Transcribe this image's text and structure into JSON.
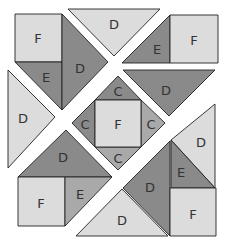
{
  "diagram": {
    "colors": {
      "light": "#dcdcdc",
      "medium": "#a9a9a9",
      "dark": "#8a8a8a",
      "outline": "#222222",
      "label": "#333333",
      "background": "#ffffff"
    },
    "pieces": [
      {
        "id": "f-top-left",
        "label": "F",
        "shape": "square",
        "shade": "light",
        "points": "15,14 62,14 62,62 15,62",
        "label_pos": [
          38,
          38
        ]
      },
      {
        "id": "e-top-left",
        "label": "E",
        "shape": "triangle",
        "shade": "dark",
        "points": "15,62 62,62 62,110",
        "label_pos": [
          46,
          77
        ]
      },
      {
        "id": "d-top-left",
        "label": "D",
        "shape": "triangle",
        "shade": "dark",
        "points": "62,14 108,62 62,110",
        "label_pos": [
          80,
          68
        ]
      },
      {
        "id": "d-top",
        "label": "D",
        "shape": "triangle",
        "shade": "light",
        "points": "68,9 160,9 114,56",
        "label_pos": [
          114,
          24
        ]
      },
      {
        "id": "e-top-right",
        "label": "E",
        "shape": "triangle",
        "shade": "dark",
        "points": "170,15 170,63 122,63",
        "label_pos": [
          157,
          49
        ]
      },
      {
        "id": "f-top-right",
        "label": "F",
        "shape": "square",
        "shade": "light",
        "points": "170,15 218,15 218,63 170,63",
        "label_pos": [
          194,
          40
        ]
      },
      {
        "id": "d-left",
        "label": "D",
        "shape": "triangle",
        "shade": "light",
        "points": "8,70 55,117 8,168",
        "label_pos": [
          23,
          118
        ]
      },
      {
        "id": "d-right-dark",
        "label": "D",
        "shape": "triangle",
        "shade": "dark",
        "points": "123,70 215,70 169,116",
        "label_pos": [
          166,
          90
        ]
      },
      {
        "id": "c-top",
        "label": "C",
        "shape": "triangle",
        "shade": "dark",
        "points": "118,76 141,100 95,100",
        "label_pos": [
          118,
          91
        ]
      },
      {
        "id": "c-left",
        "label": "C",
        "shape": "triangle",
        "shade": "dark",
        "points": "72,123 95,100 95,147",
        "label_pos": [
          85,
          124
        ]
      },
      {
        "id": "c-right",
        "label": "C",
        "shape": "triangle",
        "shade": "medium",
        "points": "165,123 141,100 141,147",
        "label_pos": [
          151,
          124
        ]
      },
      {
        "id": "c-bottom",
        "label": "C",
        "shape": "triangle",
        "shade": "medium",
        "points": "95,147 141,147 118,170",
        "label_pos": [
          118,
          158
        ]
      },
      {
        "id": "f-center",
        "label": "F",
        "shape": "square",
        "shade": "light",
        "points": "95,100 141,100 141,147 95,147",
        "label_pos": [
          118,
          124
        ]
      },
      {
        "id": "d-bottom-left-dark",
        "label": "D",
        "shape": "triangle",
        "shade": "dark",
        "points": "66,130 112,177 18,177",
        "label_pos": [
          63,
          157
        ]
      },
      {
        "id": "f-bottom-left",
        "label": "F",
        "shape": "square",
        "shade": "light",
        "points": "18,177 65,177 65,226 18,226",
        "label_pos": [
          41,
          203
        ]
      },
      {
        "id": "e-bottom-left",
        "label": "E",
        "shape": "triangle",
        "shade": "medium",
        "points": "65,177 112,177 65,226",
        "label_pos": [
          80,
          194
        ]
      },
      {
        "id": "d-right-light",
        "label": "D",
        "shape": "triangle",
        "shade": "light",
        "points": "171,140 215,104 215,188",
        "label_pos": [
          201,
          142
        ]
      },
      {
        "id": "e-bottom-right",
        "label": "E",
        "shape": "triangle",
        "shade": "dark",
        "points": "171,140 215,188 171,188",
        "label_pos": [
          181,
          172
        ]
      },
      {
        "id": "d-bottom-right-dark",
        "label": "D",
        "shape": "triangle",
        "shade": "dark",
        "points": "123,188 170,141 170,236",
        "label_pos": [
          150,
          187
        ]
      },
      {
        "id": "f-bottom-right",
        "label": "F",
        "shape": "square",
        "shade": "light",
        "points": "170,188 216,188 216,236 170,236",
        "label_pos": [
          193,
          214
        ]
      },
      {
        "id": "d-bottom-light",
        "label": "D",
        "shape": "triangle",
        "shade": "light",
        "points": "76,236 122,189 168,236",
        "label_pos": [
          122,
          220
        ]
      }
    ]
  }
}
